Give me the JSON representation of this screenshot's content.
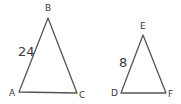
{
  "diagram": {
    "triangles": [
      {
        "id": "ABC",
        "vertices": {
          "A": {
            "label": "A",
            "x": 19,
            "y": 92
          },
          "B": {
            "label": "B",
            "x": 48,
            "y": 18
          },
          "C": {
            "label": "C",
            "x": 77,
            "y": 93
          }
        },
        "side_label": {
          "side": "AB",
          "text": "24"
        }
      },
      {
        "id": "DEF",
        "vertices": {
          "D": {
            "label": "D",
            "x": 121,
            "y": 93
          },
          "E": {
            "label": "E",
            "x": 143,
            "y": 35
          },
          "F": {
            "label": "F",
            "x": 166,
            "y": 93
          }
        },
        "side_label": {
          "side": "DE",
          "text": "8"
        }
      }
    ],
    "colors": {
      "line": "#555555",
      "text": "#3a3a3a",
      "background": "#ffffff"
    }
  }
}
